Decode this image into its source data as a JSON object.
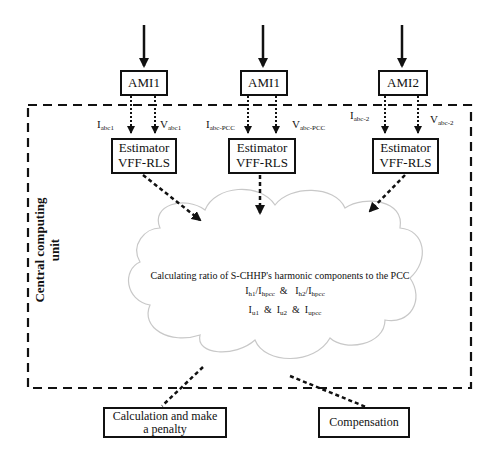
{
  "diagram": {
    "container": {
      "label_line1": "Central computing",
      "label_line2": "unit"
    },
    "meters": [
      {
        "label": "AMI1",
        "estimator_line1": "Estimator",
        "estimator_line2": "VFF-RLS",
        "current": {
          "base": "I",
          "sub": "abc1"
        },
        "voltage": {
          "base": "V",
          "sub": "abc1"
        }
      },
      {
        "label": "AMI1",
        "estimator_line1": "Estimator",
        "estimator_line2": "VFF-RLS",
        "current": {
          "base": "I",
          "sub": "abc-PCC"
        },
        "voltage": {
          "base": "V",
          "sub": "abc-PCC"
        }
      },
      {
        "label": "AMI2",
        "estimator_line1": "Estimator",
        "estimator_line2": "VFF-RLS",
        "current": {
          "base": "I",
          "sub": "abc-2"
        },
        "voltage": {
          "base": "V",
          "sub": "abc-2"
        }
      }
    ],
    "cloud": {
      "title": "Calculating ratio of S-CHHP's harmonic components to the PCC",
      "ratio1": {
        "num": "I",
        "num_sub": "h1",
        "den": "I",
        "den_sub": "hpcc"
      },
      "amp1": "&",
      "ratio2": {
        "num": "I",
        "num_sub": "h2",
        "den": "I",
        "den_sub": "hpcc"
      },
      "line3": [
        {
          "base": "I",
          "sub": "u1"
        },
        {
          "base": "I",
          "sub": "u2"
        },
        {
          "base": "I",
          "sub": "upcc"
        }
      ],
      "amp2": "&",
      "amp3": "&"
    },
    "outputs": [
      {
        "line1": "Calculation and make",
        "line2": "a penalty"
      },
      {
        "line1": "Compensation"
      }
    ],
    "colors": {
      "stroke": "#111111",
      "cloud_stroke": "#c8c8c8",
      "background": "#ffffff"
    }
  }
}
